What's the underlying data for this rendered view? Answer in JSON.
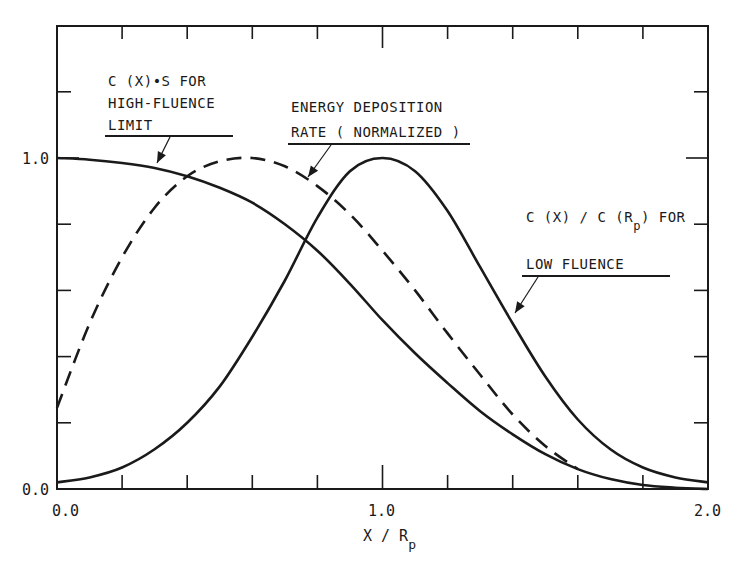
{
  "chart_data": {
    "type": "line",
    "title": "",
    "xlabel": "X/Rp",
    "ylabel": "",
    "xlim": [
      0.0,
      2.0
    ],
    "ylim": [
      0.0,
      1.4
    ],
    "grid": false,
    "legend": "none (curves labeled by in-plot annotations with arrows)",
    "x_ticks": [
      0.0,
      0.2,
      0.4,
      0.6,
      0.8,
      1.0,
      1.2,
      1.4,
      1.6,
      1.8,
      2.0
    ],
    "x_tick_labels": {
      "0.0": "0.0",
      "1.0": "1.0",
      "2.0": "2.0"
    },
    "y_ticks": [
      0.0,
      0.2,
      0.4,
      0.6,
      0.8,
      1.0,
      1.2
    ],
    "y_tick_labels": {
      "0.0": "0.0",
      "1.0": "1.0"
    },
    "series": [
      {
        "name": "C(X)·S for high-fluence limit",
        "style": "solid",
        "x": [
          0.0,
          0.1,
          0.2,
          0.3,
          0.4,
          0.5,
          0.6,
          0.7,
          0.8,
          0.9,
          1.0,
          1.1,
          1.2,
          1.3,
          1.4,
          1.5,
          1.6,
          1.7,
          1.8,
          1.9,
          2.0
        ],
        "values": [
          1.0,
          0.995,
          0.985,
          0.97,
          0.945,
          0.91,
          0.865,
          0.8,
          0.72,
          0.62,
          0.51,
          0.41,
          0.32,
          0.235,
          0.165,
          0.105,
          0.06,
          0.03,
          0.012,
          0.004,
          0.0
        ]
      },
      {
        "name": "Energy deposition rate (normalized)",
        "style": "dashed",
        "x": [
          0.0,
          0.1,
          0.2,
          0.3,
          0.4,
          0.5,
          0.6,
          0.7,
          0.8,
          0.9,
          1.0,
          1.1,
          1.2,
          1.3,
          1.4,
          1.5,
          1.6
        ],
        "values": [
          0.245,
          0.5,
          0.7,
          0.85,
          0.945,
          0.99,
          1.0,
          0.975,
          0.915,
          0.83,
          0.72,
          0.6,
          0.47,
          0.345,
          0.225,
          0.13,
          0.06
        ]
      },
      {
        "name": "C(X)/C(Rp) for low fluence",
        "style": "solid",
        "x": [
          0.0,
          0.1,
          0.2,
          0.3,
          0.4,
          0.5,
          0.6,
          0.7,
          0.8,
          0.9,
          1.0,
          1.1,
          1.2,
          1.3,
          1.4,
          1.5,
          1.6,
          1.7,
          1.8,
          1.9,
          2.0
        ],
        "values": [
          0.02,
          0.035,
          0.065,
          0.12,
          0.2,
          0.31,
          0.46,
          0.63,
          0.82,
          0.96,
          1.0,
          0.96,
          0.84,
          0.67,
          0.5,
          0.34,
          0.21,
          0.12,
          0.065,
          0.035,
          0.02
        ]
      }
    ],
    "annotations": [
      {
        "id": "high_fluence",
        "lines": [
          "C (X)•S FOR",
          "HIGH-FLUENCE",
          "LIMIT"
        ],
        "label_xy_px": [
          108,
          86
        ],
        "underline_px": [
          105,
          233,
          136
        ],
        "arrow_px": [
          [
            170,
            137
          ],
          [
            157,
            163
          ]
        ]
      },
      {
        "id": "energy_deposition",
        "lines": [
          "ENERGY DEPOSITION",
          "RATE ( NORMALIZED )"
        ],
        "label_xy_px": [
          292,
          112
        ],
        "underline_px": [
          288,
          470,
          144
        ],
        "arrow_px": [
          [
            331,
            145
          ],
          [
            308,
            177
          ]
        ]
      },
      {
        "id": "low_fluence",
        "lines": [
          "C (X) / C (R",
          "p",
          ") FOR",
          "LOW FLUENCE"
        ],
        "label_xy_px": [
          526,
          222
        ],
        "underline_px": [
          522,
          670,
          276
        ],
        "arrow_px": [
          [
            538,
            277
          ],
          [
            515,
            313
          ]
        ]
      }
    ]
  },
  "axes": {
    "x_label_main": "X / R",
    "x_label_sub": "p",
    "tick_0": "0.0",
    "tick_1": "1.0",
    "tick_2": "2.0"
  },
  "labels": {
    "high_fluence": [
      "C (X)•S FOR",
      "HIGH-FLUENCE",
      "LIMIT"
    ],
    "energy": [
      "ENERGY DEPOSITION",
      "RATE ( NORMALIZED )"
    ],
    "low_fluence_line1_a": "C (X) / C (R",
    "low_fluence_line1_sub": "p",
    "low_fluence_line1_b": ") FOR",
    "low_fluence_line2": "LOW FLUENCE"
  },
  "colors": {
    "ink": "#1a1a1a",
    "background": "#ffffff"
  }
}
